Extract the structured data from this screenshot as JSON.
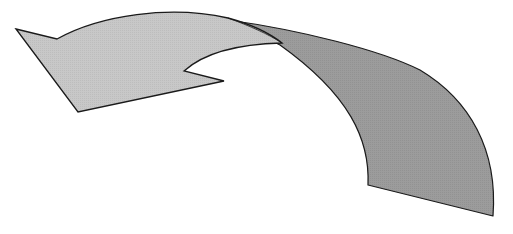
{
  "diagram": {
    "type": "curved-arrow",
    "direction": "left",
    "colors": {
      "background": "#ffffff",
      "arrow_head_fill": "#c8c8c8",
      "tail_fill": "#9c9c9c",
      "outline": "#1a1a1a"
    }
  }
}
